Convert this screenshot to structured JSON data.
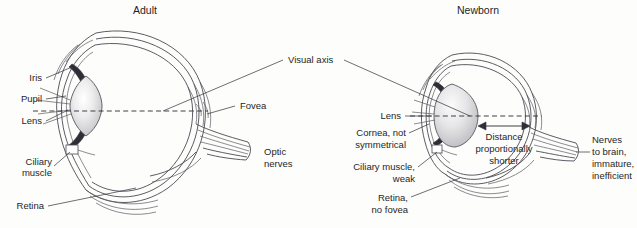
{
  "figure": {
    "kind": "anatomical-comparison-diagram",
    "background_color": "#fdfdfc",
    "line_color": "#4a4a52",
    "text_color": "#262626"
  },
  "panels": {
    "left": {
      "title": "Adult",
      "labels": {
        "iris": "Iris",
        "pupil": "Pupil",
        "lens": "Lens",
        "ciliary_muscle": "Ciliary\nmuscle",
        "ciliary_muscle_line1": "Ciliary",
        "ciliary_muscle_line2": "muscle",
        "retina": "Retina",
        "fovea": "Fovea",
        "optic_nerves_line1": "Optic",
        "optic_nerves_line2": "nerves"
      }
    },
    "right": {
      "title": "Newborn",
      "labels": {
        "lens": "Lens",
        "cornea_line1": "Cornea, not",
        "cornea_line2": "symmetrical",
        "ciliary_line1": "Ciliary muscle,",
        "ciliary_line2": "weak",
        "retina_line1": "Retina,",
        "retina_line2": "no fovea",
        "nerves_line1": "Nerves",
        "nerves_line2": "to brain,",
        "nerves_line3": "immature,",
        "nerves_line4": "inefficient",
        "distance_line1": "Distance",
        "distance_line2": "proportionally",
        "distance_line3": "shorter"
      }
    }
  },
  "shared": {
    "visual_axis_label": "Visual axis"
  }
}
